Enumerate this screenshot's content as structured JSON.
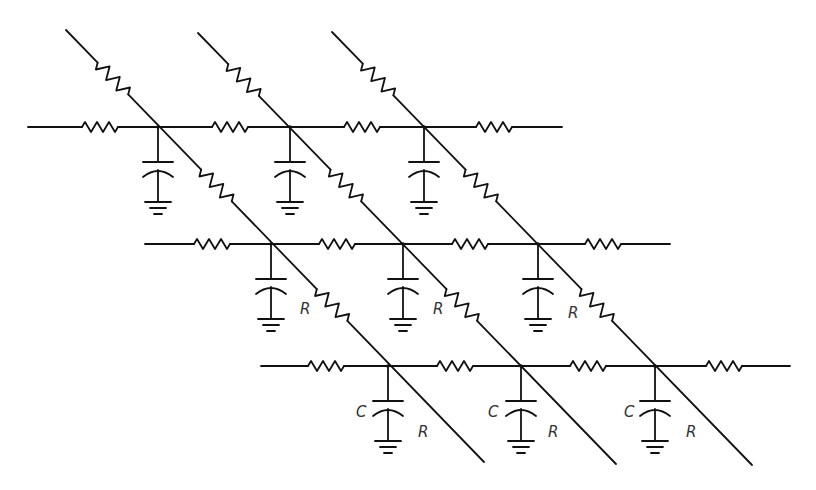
{
  "diagram": {
    "labels": {
      "resistor": "R",
      "capacitor": "C"
    },
    "stroke_color": "#111111",
    "rows": [
      {
        "y": 127,
        "x_start": 28,
        "x_end": 562,
        "nodes": [
          158,
          290,
          424
        ],
        "resistors": [
          100,
          230,
          362,
          494
        ]
      },
      {
        "y": 244,
        "x_start": 145,
        "x_end": 670,
        "nodes": [
          271,
          403,
          538
        ],
        "resistors": [
          212,
          337,
          470,
          603
        ]
      },
      {
        "y": 366,
        "x_start": 261,
        "x_end": 790,
        "nodes": [
          388,
          521,
          655
        ],
        "resistors": [
          326,
          455,
          588,
          724
        ]
      }
    ],
    "diagonals": [
      {
        "start": [
          66,
          30
        ],
        "end": [
          484,
          462
        ]
      },
      {
        "start": [
          198,
          33
        ],
        "end": [
          616,
          464
        ]
      },
      {
        "start": [
          332,
          32
        ],
        "end": [
          752,
          465
        ]
      }
    ],
    "r_labels": [
      {
        "text": "R",
        "x": 300,
        "y": 314
      },
      {
        "text": "R",
        "x": 433,
        "y": 314
      },
      {
        "text": "R",
        "x": 568,
        "y": 318
      },
      {
        "text": "R",
        "x": 418,
        "y": 437
      },
      {
        "text": "R",
        "x": 548,
        "y": 437
      },
      {
        "text": "R",
        "x": 686,
        "y": 437
      }
    ],
    "c_labels": [
      {
        "text": "C",
        "x": 356,
        "y": 417
      },
      {
        "text": "C",
        "x": 488,
        "y": 417
      },
      {
        "text": "C",
        "x": 624,
        "y": 417
      }
    ]
  }
}
